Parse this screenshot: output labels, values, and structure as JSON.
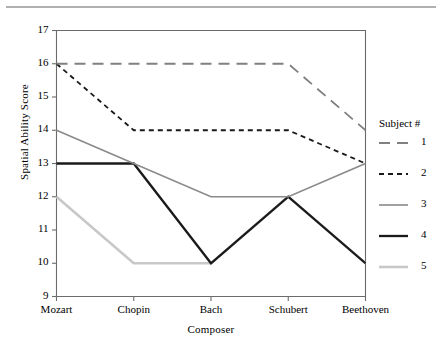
{
  "chart_data": {
    "type": "line",
    "title": "",
    "xlabel": "Composer",
    "ylabel": "Spatial Ability Score",
    "categories": [
      "Mozart",
      "Chopin",
      "Bach",
      "Schubert",
      "Beethoven"
    ],
    "ylim": [
      9,
      17
    ],
    "yticks": [
      9,
      10,
      11,
      12,
      13,
      14,
      15,
      16,
      17
    ],
    "grid": false,
    "legend_position": "right",
    "legend_title": "Subject #",
    "series": [
      {
        "name": "1",
        "values": [
          16,
          16,
          16,
          16,
          14
        ],
        "color": "#808080",
        "dash": "11,7",
        "width": 1.8
      },
      {
        "name": "2",
        "values": [
          16,
          14,
          14,
          14,
          13
        ],
        "color": "#1a1a1a",
        "dash": "5,4",
        "width": 1.8
      },
      {
        "name": "3",
        "values": [
          14,
          13,
          12,
          12,
          13
        ],
        "color": "#8a8a8a",
        "dash": "",
        "width": 1.6
      },
      {
        "name": "4",
        "values": [
          13,
          13,
          10,
          12,
          10
        ],
        "color": "#1a1a1a",
        "dash": "",
        "width": 2.3
      },
      {
        "name": "5",
        "values": [
          12,
          10,
          10,
          12,
          10
        ],
        "color": "#c8c8c8",
        "dash": "",
        "width": 2.6
      }
    ]
  },
  "axes": {
    "y_title": "Spatial Ability Score",
    "x_title": "Composer",
    "y_tick_labels": [
      "17",
      "16",
      "15",
      "14",
      "13",
      "12",
      "11",
      "10",
      "9"
    ],
    "x_tick_labels": [
      "Mozart",
      "Chopin",
      "Bach",
      "Schubert",
      "Beethoven"
    ]
  },
  "legend": {
    "title": "Subject #",
    "items": [
      {
        "label": "1"
      },
      {
        "label": "2"
      },
      {
        "label": "3"
      },
      {
        "label": "4"
      },
      {
        "label": "5"
      }
    ]
  },
  "colors": {
    "axis": "#6b6b6b",
    "text": "#000000",
    "rule": "#b0b0b0",
    "background": "#ffffff"
  }
}
